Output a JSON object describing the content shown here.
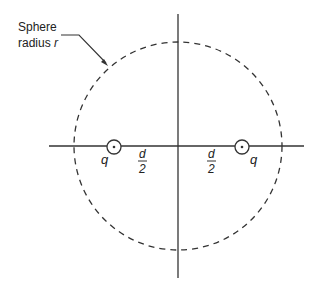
{
  "diagram": {
    "title_label": {
      "line1": "Sphere",
      "line2_prefix": "radius ",
      "line2_var": "r"
    },
    "charges": [
      {
        "symbol": "q",
        "side": "left"
      },
      {
        "symbol": "q",
        "side": "right"
      }
    ],
    "distances": [
      {
        "numerator": "d",
        "denominator": "2",
        "side": "left"
      },
      {
        "numerator": "d",
        "denominator": "2",
        "side": "right"
      }
    ],
    "colors": {
      "line": "#333333",
      "background": "#ffffff"
    }
  }
}
